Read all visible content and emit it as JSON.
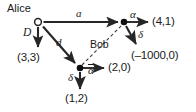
{
  "diagram": {
    "type": "extensive-form-game-tree",
    "players": {
      "alice": "Alice",
      "bob": "Bob"
    },
    "actions": {
      "alice_deviate": "D",
      "alice_a": "a",
      "alice_d": "d",
      "bob_top_alpha": "α",
      "bob_top_delta": "δ",
      "bob_bottom_alpha": "α",
      "bob_bottom_delta": "δ"
    },
    "payoffs": {
      "alice_outside": "(3,3)",
      "top_alpha": "(4,1)",
      "top_delta": "(–1000,0)",
      "bottom_alpha": "(2,0)",
      "bottom_delta": "(1,2)"
    },
    "colors": {
      "ink": "#1a1a1a",
      "line": "#262626",
      "background": "#ffffff"
    },
    "nodes": [
      {
        "id": "root",
        "label": "Alice",
        "style": "open-circle",
        "x": 38,
        "y": 22
      },
      {
        "id": "bob-top",
        "label": "Bob",
        "style": "filled-dot",
        "x": 124,
        "y": 22
      },
      {
        "id": "bob-bottom",
        "label": "Bob",
        "style": "filled-dot",
        "x": 80,
        "y": 68
      }
    ],
    "information_set": {
      "owner": "Bob",
      "style": "dashed",
      "connects": [
        "bob-bottom",
        "bob-top"
      ]
    }
  }
}
